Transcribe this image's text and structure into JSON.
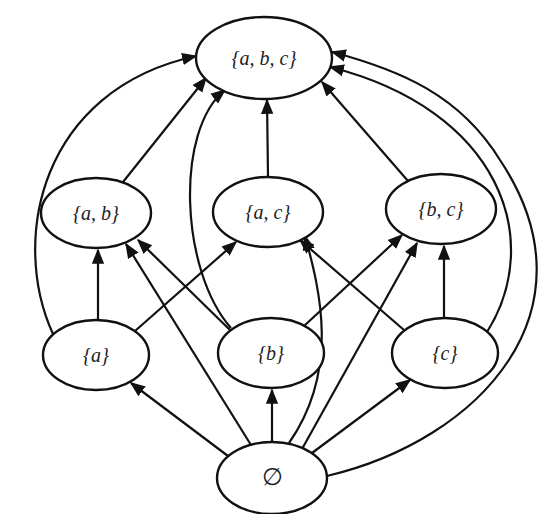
{
  "diagram": {
    "colors": {
      "stroke": "#111111",
      "fill": "#ffffff",
      "text": "#222222"
    },
    "nodes": [
      {
        "id": "abc",
        "label": "{a, b, c}",
        "cx": 264,
        "cy": 58,
        "rx": 68,
        "ry": 41
      },
      {
        "id": "ab",
        "label": "{a, b}",
        "cx": 96,
        "cy": 213,
        "rx": 55,
        "ry": 35
      },
      {
        "id": "ac",
        "label": "{a, c}",
        "cx": 268,
        "cy": 212,
        "rx": 55,
        "ry": 35
      },
      {
        "id": "bc",
        "label": "{b, c}",
        "cx": 441,
        "cy": 209,
        "rx": 55,
        "ry": 35
      },
      {
        "id": "a",
        "label": "{a}",
        "cx": 96,
        "cy": 355,
        "rx": 53,
        "ry": 35
      },
      {
        "id": "b",
        "label": "{b}",
        "cx": 271,
        "cy": 353,
        "rx": 53,
        "ry": 35
      },
      {
        "id": "c",
        "label": "{c}",
        "cx": 445,
        "cy": 353,
        "rx": 53,
        "ry": 35
      },
      {
        "id": "empty",
        "label": "∅",
        "cx": 272,
        "cy": 478,
        "rx": 55,
        "ry": 36
      }
    ],
    "edges": [
      {
        "from": "ab",
        "to": "abc",
        "d": "M123,182 L206,78"
      },
      {
        "from": "ac",
        "to": "abc",
        "d": "M268,177 L267,100"
      },
      {
        "from": "bc",
        "to": "abc",
        "d": "M408,181 L322,82"
      },
      {
        "from": "a",
        "to": "abc",
        "d": "M53,334 C10,240 40,90 196,56"
      },
      {
        "from": "b",
        "to": "abc",
        "d": "M231,328 C180,270 175,130 225,90"
      },
      {
        "from": "c",
        "to": "abc",
        "d": "M487,332 C545,240 500,110 330,67"
      },
      {
        "from": "empty",
        "to": "abc",
        "d": "M327,476 C480,440 600,310 500,160 C460,95 400,70 332,52"
      },
      {
        "from": "a",
        "to": "ab",
        "d": "M98,320 L98,250"
      },
      {
        "from": "a",
        "to": "ac",
        "d": "M135,331 L236,242"
      },
      {
        "from": "b",
        "to": "ab",
        "d": "M230,330 L138,240"
      },
      {
        "from": "b",
        "to": "bc",
        "d": "M304,326 L402,235"
      },
      {
        "from": "c",
        "to": "ac",
        "d": "M404,330 L300,240"
      },
      {
        "from": "c",
        "to": "bc",
        "d": "M444,318 L444,246"
      },
      {
        "from": "empty",
        "to": "a",
        "d": "M228,456 L131,383"
      },
      {
        "from": "empty",
        "to": "b",
        "d": "M272,442 L272,390"
      },
      {
        "from": "empty",
        "to": "c",
        "d": "M312,453 L410,380"
      },
      {
        "from": "empty",
        "to": "ab",
        "d": "M251,445 L126,244"
      },
      {
        "from": "empty",
        "to": "ac",
        "d": "M289,443 C340,370 320,290 305,236"
      },
      {
        "from": "empty",
        "to": "bc",
        "d": "M302,449 L417,243"
      }
    ]
  }
}
